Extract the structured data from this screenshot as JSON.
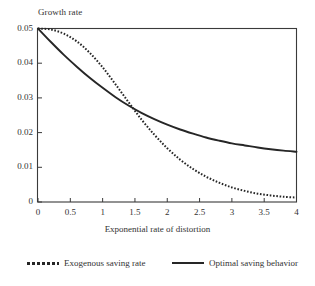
{
  "chart_data": {
    "type": "line",
    "title": "",
    "xlabel": "Exponential rate of distortion",
    "ylabel": "Growth rate",
    "xlim": [
      0,
      4
    ],
    "ylim": [
      0,
      0.05
    ],
    "grid": false,
    "legend_position": "bottom",
    "xticks": [
      "0",
      "0.5",
      "1",
      "1.5",
      "2",
      "2.5",
      "3",
      "3.5",
      "4"
    ],
    "xtick_values": [
      0,
      0.5,
      1,
      1.5,
      2,
      2.5,
      3,
      3.5,
      4
    ],
    "yticks": [
      "0",
      "0.01",
      "0.02",
      "0.03",
      "0.04",
      "0.05"
    ],
    "ytick_values": [
      0,
      0.01,
      0.02,
      0.03,
      0.04,
      0.05
    ],
    "x": [
      0,
      0.2,
      0.4,
      0.6,
      0.8,
      1.0,
      1.2,
      1.4,
      1.6,
      1.8,
      2.0,
      2.2,
      2.4,
      2.6,
      2.8,
      3.0,
      3.2,
      3.4,
      3.6,
      3.8,
      4.0
    ],
    "series": [
      {
        "name": "Exogenous saving rate",
        "style": "dotted",
        "color": "#262626",
        "values": [
          0.05,
          0.0497,
          0.0485,
          0.0463,
          0.043,
          0.0388,
          0.0339,
          0.0288,
          0.0238,
          0.0194,
          0.0155,
          0.0122,
          0.0095,
          0.0073,
          0.0056,
          0.0042,
          0.0032,
          0.0024,
          0.0019,
          0.0015,
          0.0013
        ]
      },
      {
        "name": "Optimal saving behavior",
        "style": "solid",
        "color": "#262626",
        "values": [
          0.05,
          0.0461,
          0.0424,
          0.039,
          0.0358,
          0.0329,
          0.0302,
          0.0278,
          0.0257,
          0.0239,
          0.0223,
          0.0209,
          0.0197,
          0.0186,
          0.0177,
          0.0169,
          0.0163,
          0.0157,
          0.0152,
          0.0148,
          0.0145
        ]
      }
    ],
    "annotations": {
      "crossing_point": {
        "x": 1.45,
        "y": 0.0224
      }
    }
  },
  "legend": {
    "entries": [
      {
        "label": "Exogenous saving rate",
        "style": "dotted"
      },
      {
        "label": "Optimal saving behavior",
        "style": "solid"
      }
    ]
  }
}
